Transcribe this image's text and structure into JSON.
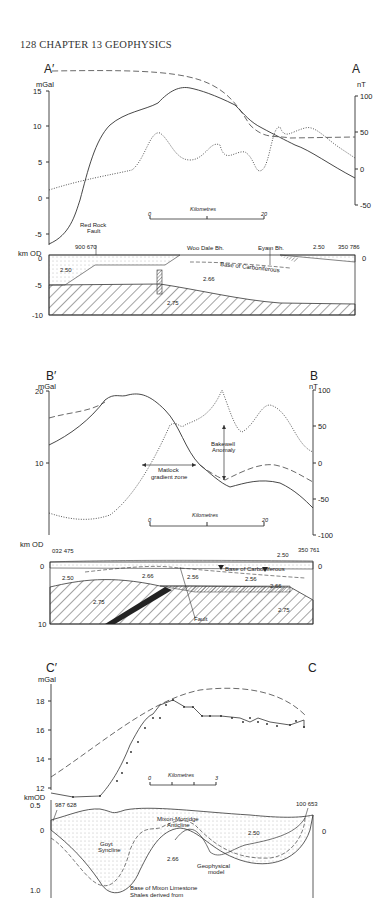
{
  "page": {
    "header": "128   CHAPTER 13   GEOPHYSICS"
  },
  "panels": [
    {
      "id": "A",
      "left_label": "A′",
      "right_label": "A",
      "left_unit": "mGal",
      "right_unit": "nT",
      "left_ticks": [
        "15",
        "10",
        "5",
        "0",
        "-5"
      ],
      "right_ticks": [
        "100",
        "50",
        "0",
        "-50"
      ],
      "section_unit": "km OD",
      "section_ticks": [
        "0",
        "-5",
        "-10"
      ],
      "section_right_tick": "0",
      "scale_label": "Kilometres",
      "scale_start": "0",
      "scale_end": "20",
      "annotations": {
        "fault": "Red Rock\nFault",
        "fault_l1": "Red Rock",
        "fault_l2": "Fault",
        "grid_left": "900 670",
        "grid_right": "350 786",
        "borehole1": "Woo Dale Bh.",
        "borehole2": "Eyam Bh.",
        "base": "Base of Carboniferous",
        "d1": "2.50",
        "d2": "2.66",
        "d3": "2.75",
        "d4": "2.50"
      }
    },
    {
      "id": "B",
      "left_label": "B′",
      "right_label": "B",
      "left_unit": "mGal",
      "right_unit": "nT",
      "left_ticks": [
        "20",
        "10"
      ],
      "right_ticks": [
        "100",
        "50",
        "0",
        "-50",
        "-100"
      ],
      "section_unit": "km OD",
      "section_ticks": [
        "0",
        "10"
      ],
      "section_right_tick": "0",
      "scale_label": "Kilometres",
      "scale_start": "0",
      "scale_end": "20",
      "annotations": {
        "bakewell_l1": "Bakewell",
        "bakewell_l2": "Anomaly",
        "matlock_l1": "Matlock",
        "matlock_l2": "gradient zone",
        "grid_left": "032 475",
        "grid_right": "350 761",
        "base": "Base of Carboniferous",
        "fault": "Fault",
        "d1": "2.50",
        "d2": "2.66",
        "d3": "2.56",
        "d4": "2.56",
        "d5": "2.66",
        "d6": "2.75",
        "d7": "2.75",
        "d8": "2.50"
      }
    },
    {
      "id": "C",
      "left_label": "C′",
      "right_label": "C",
      "left_unit": "mGal",
      "left_ticks": [
        "18",
        "16",
        "14",
        "12"
      ],
      "section_unit": "kmOD",
      "section_ticks": [
        "0.5",
        "0",
        "1.0"
      ],
      "section_right_tick": "0",
      "scale_label": "Kilometres",
      "scale_start": "0",
      "scale_end": "3",
      "annotations": {
        "grid_left": "987 628",
        "grid_right": "100 653",
        "anticline_l1": "Mixon-Morridge",
        "anticline_l2": "Anticline",
        "syncline_l1": "Goyt",
        "syncline_l2": "Syncline",
        "model_l1": "Geophysical",
        "model_l2": "model",
        "base_l1": "Base of Mixon Limestone",
        "base_l2": "Shales derived  from",
        "d1": "2.50",
        "d2": "2.66"
      }
    }
  ]
}
